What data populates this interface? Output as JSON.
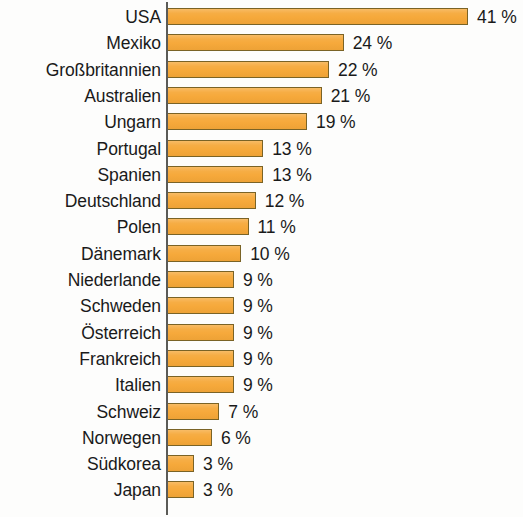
{
  "chart": {
    "type": "bar",
    "title": "",
    "subtitle": "",
    "xlabel": "",
    "ylabel": "",
    "orientation": "horizontal",
    "value_suffix": "%",
    "axis_color": "#5b5b57",
    "bar_fill_color": "#f6a93b",
    "bar_border_color": "#7a6326",
    "text_color": "#1a1a1a",
    "background_color": "#fdfdfc",
    "grid": false,
    "legend": "none",
    "xlim": [
      0,
      41
    ]
  },
  "chart_data": {
    "type": "bar",
    "title": "",
    "xlabel": "",
    "ylabel": "",
    "xlim": [
      0,
      41
    ],
    "grid": false,
    "legend": "none",
    "categories": [
      "USA",
      "Mexiko",
      "Großbritannien",
      "Australien",
      "Ungarn",
      "Portugal",
      "Spanien",
      "Deutschland",
      "Polen",
      "Dänemark",
      "Niederlande",
      "Schweden",
      "Österreich",
      "Frankreich",
      "Italien",
      "Schweiz",
      "Norwegen",
      "Südkorea",
      "Japan"
    ],
    "values": [
      41,
      24,
      22,
      21,
      19,
      13,
      13,
      12,
      11,
      10,
      9,
      9,
      9,
      9,
      9,
      7,
      6,
      3,
      3
    ],
    "value_labels": [
      "41 %",
      "24 %",
      "22 %",
      "21 %",
      "19 %",
      "13 %",
      "13 %",
      "12 %",
      "11 %",
      "10 %",
      "9 %",
      "9 %",
      "9 %",
      "9 %",
      "9 %",
      "7 %",
      "6 %",
      "3 %",
      "3 %"
    ]
  }
}
